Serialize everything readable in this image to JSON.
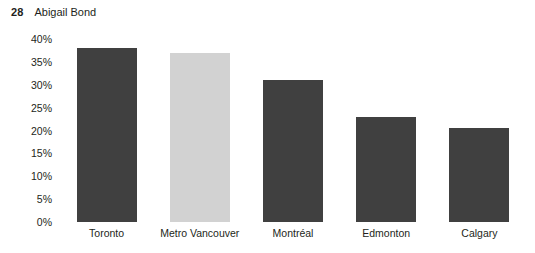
{
  "header": {
    "number": "28",
    "name": "Abigail Bond"
  },
  "chart_data": {
    "type": "bar",
    "title": "",
    "xlabel": "",
    "ylabel": "",
    "categories": [
      "Toronto",
      "Metro Vancouver",
      "Montréal",
      "Edmonton",
      "Calgary"
    ],
    "values": [
      38,
      37,
      31,
      23,
      20.5
    ],
    "value_labels": [
      "38%",
      "37%",
      "31%",
      "23%",
      "20.5%"
    ],
    "ylim": [
      0,
      40
    ],
    "ytick_values": [
      40,
      35,
      30,
      25,
      20,
      15,
      10,
      5,
      0
    ],
    "ytick_labels": [
      "40%",
      "35%",
      "30%",
      "25%",
      "20%",
      "15%",
      "10%",
      "5%",
      "0%"
    ],
    "grid": false,
    "legend": false,
    "background_color": "#ffffff",
    "bar_colors": [
      "#404040",
      "#d2d2d2",
      "#404040",
      "#404040",
      "#404040"
    ],
    "highlight_category": "Metro Vancouver",
    "highlight_color": "#d2d2d2",
    "default_bar_color": "#404040"
  }
}
